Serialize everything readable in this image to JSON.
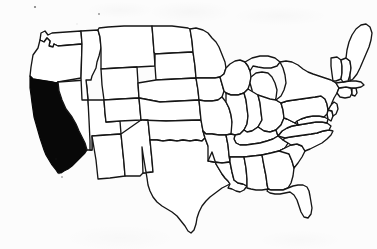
{
  "figure": {
    "type": "choropleth-outline-map",
    "title": "",
    "alt_text": "Outline map of the contiguous United States with California shaded solid black"
  },
  "canvas": {
    "width": 377,
    "height": 249,
    "background_color": "#fcfcfc"
  },
  "style": {
    "outline_color": "#151515",
    "outline_width_px": 1.35,
    "default_fill": "#ffffff",
    "highlight_fill": "#080808",
    "render_quality": "scanned-line-art"
  },
  "map_data": {
    "type": "choropleth",
    "region": "contiguous-united-states",
    "projection_look": "simplified-equal-area",
    "highlighted_states": [
      "California"
    ],
    "highlighted_count": 1,
    "legend": {
      "visible": false,
      "entries": []
    },
    "labels": {
      "visible": false,
      "state_labels": []
    },
    "states": [
      {
        "name": "Washington",
        "abbr": "WA",
        "highlighted": false
      },
      {
        "name": "Oregon",
        "abbr": "OR",
        "highlighted": false
      },
      {
        "name": "California",
        "abbr": "CA",
        "highlighted": true
      },
      {
        "name": "Idaho",
        "abbr": "ID",
        "highlighted": false
      },
      {
        "name": "Nevada",
        "abbr": "NV",
        "highlighted": false
      },
      {
        "name": "Montana",
        "abbr": "MT",
        "highlighted": false
      },
      {
        "name": "Wyoming",
        "abbr": "WY",
        "highlighted": false
      },
      {
        "name": "Utah",
        "abbr": "UT",
        "highlighted": false
      },
      {
        "name": "Arizona",
        "abbr": "AZ",
        "highlighted": false
      },
      {
        "name": "Colorado",
        "abbr": "CO",
        "highlighted": false
      },
      {
        "name": "New Mexico",
        "abbr": "NM",
        "highlighted": false
      },
      {
        "name": "North Dakota",
        "abbr": "ND",
        "highlighted": false
      },
      {
        "name": "South Dakota",
        "abbr": "SD",
        "highlighted": false
      },
      {
        "name": "Nebraska",
        "abbr": "NE",
        "highlighted": false
      },
      {
        "name": "Kansas",
        "abbr": "KS",
        "highlighted": false
      },
      {
        "name": "Oklahoma",
        "abbr": "OK",
        "highlighted": false
      },
      {
        "name": "Texas",
        "abbr": "TX",
        "highlighted": false
      },
      {
        "name": "Minnesota",
        "abbr": "MN",
        "highlighted": false
      },
      {
        "name": "Iowa",
        "abbr": "IA",
        "highlighted": false
      },
      {
        "name": "Missouri",
        "abbr": "MO",
        "highlighted": false
      },
      {
        "name": "Arkansas",
        "abbr": "AR",
        "highlighted": false
      },
      {
        "name": "Louisiana",
        "abbr": "LA",
        "highlighted": false
      },
      {
        "name": "Wisconsin",
        "abbr": "WI",
        "highlighted": false
      },
      {
        "name": "Illinois",
        "abbr": "IL",
        "highlighted": false
      },
      {
        "name": "Michigan",
        "abbr": "MI",
        "highlighted": false
      },
      {
        "name": "Indiana",
        "abbr": "IN",
        "highlighted": false
      },
      {
        "name": "Ohio",
        "abbr": "OH",
        "highlighted": false
      },
      {
        "name": "Kentucky",
        "abbr": "KY",
        "highlighted": false
      },
      {
        "name": "Tennessee",
        "abbr": "TN",
        "highlighted": false
      },
      {
        "name": "Mississippi",
        "abbr": "MS",
        "highlighted": false
      },
      {
        "name": "Alabama",
        "abbr": "AL",
        "highlighted": false
      },
      {
        "name": "Georgia",
        "abbr": "GA",
        "highlighted": false
      },
      {
        "name": "Florida",
        "abbr": "FL",
        "highlighted": false
      },
      {
        "name": "South Carolina",
        "abbr": "SC",
        "highlighted": false
      },
      {
        "name": "North Carolina",
        "abbr": "NC",
        "highlighted": false
      },
      {
        "name": "Virginia",
        "abbr": "VA",
        "highlighted": false
      },
      {
        "name": "West Virginia",
        "abbr": "WV",
        "highlighted": false
      },
      {
        "name": "Maryland",
        "abbr": "MD",
        "highlighted": false
      },
      {
        "name": "Delaware",
        "abbr": "DE",
        "highlighted": false
      },
      {
        "name": "Pennsylvania",
        "abbr": "PA",
        "highlighted": false
      },
      {
        "name": "New Jersey",
        "abbr": "NJ",
        "highlighted": false
      },
      {
        "name": "New York",
        "abbr": "NY",
        "highlighted": false
      },
      {
        "name": "Connecticut",
        "abbr": "CT",
        "highlighted": false
      },
      {
        "name": "Rhode Island",
        "abbr": "RI",
        "highlighted": false
      },
      {
        "name": "Massachusetts",
        "abbr": "MA",
        "highlighted": false
      },
      {
        "name": "Vermont",
        "abbr": "VT",
        "highlighted": false
      },
      {
        "name": "New Hampshire",
        "abbr": "NH",
        "highlighted": false
      },
      {
        "name": "Maine",
        "abbr": "ME",
        "highlighted": false
      }
    ]
  }
}
